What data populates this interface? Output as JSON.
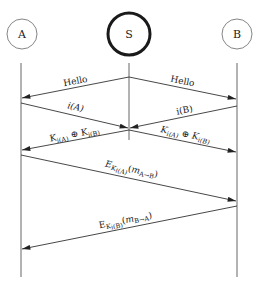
{
  "diagram": {
    "type": "sequence-diagram",
    "participants": [
      {
        "id": "A",
        "label": "A",
        "x": 22,
        "cy": 34,
        "r": 15,
        "emphasis": false
      },
      {
        "id": "S",
        "label": "S",
        "x": 129,
        "cy": 34,
        "r": 21,
        "emphasis": true
      },
      {
        "id": "B",
        "label": "B",
        "x": 237,
        "cy": 34,
        "r": 15,
        "emphasis": false
      }
    ],
    "messages": [
      {
        "from": "S",
        "to": "A",
        "label": "Hello"
      },
      {
        "from": "S",
        "to": "B",
        "label": "Hello"
      },
      {
        "from": "A",
        "to": "S",
        "label": "i(A)"
      },
      {
        "from": "B",
        "to": "S",
        "label": "i(B)"
      },
      {
        "from": "S",
        "to": "A",
        "label": "K_{i(A)} ⊕ K_{i(B)}"
      },
      {
        "from": "S",
        "to": "B",
        "label": "K_{i(A)} ⊕ K_{i(B)}"
      },
      {
        "from": "A",
        "to": "B",
        "label": "E_{K_{i(A)}}(m_{A→B})"
      },
      {
        "from": "B",
        "to": "A",
        "label": "E_{K_{i(B)}}(m_{B→A})"
      }
    ]
  },
  "labels": {
    "A": "A",
    "S": "S",
    "B": "B",
    "hello_left": "Hello",
    "hello_right": "Hello",
    "iA": "i(A)",
    "iB": "i(B)",
    "K": "K",
    "i_A_sub": "i(A)",
    "i_B_sub": "i(B)",
    "xor": " ⊕ ",
    "E": "E",
    "paren_open": "(",
    "paren_close": ")",
    "m": "m",
    "A_to_B": "A→B",
    "B_to_A": "B→A"
  }
}
